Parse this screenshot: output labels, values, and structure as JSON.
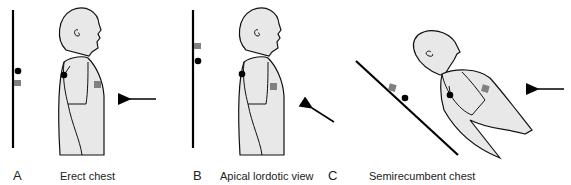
{
  "panels": [
    {
      "letter": "A",
      "caption": "Erect chest",
      "arrow_direction": "horizontal-left"
    },
    {
      "letter": "B",
      "caption": "Apical lordotic view",
      "arrow_direction": "diagonal-up-left"
    },
    {
      "letter": "C",
      "caption": "Semirecumbent chest",
      "arrow_direction": "horizontal-left"
    }
  ],
  "legend_markers": {
    "dot": {
      "shape": "circle",
      "color": "#000000"
    },
    "square": {
      "shape": "square",
      "color": "#808080"
    }
  },
  "colors": {
    "figure_fill": "#e8e8e8",
    "outline": "#111111",
    "film_line": "#000000"
  }
}
